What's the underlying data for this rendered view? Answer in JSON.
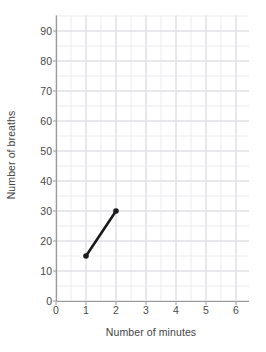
{
  "chart_data": {
    "type": "line",
    "title": "",
    "xlabel": "Number of minutes",
    "ylabel": "Number of breaths",
    "x": [
      1,
      2
    ],
    "values": [
      15,
      30
    ],
    "series": [
      {
        "name": "breaths",
        "x": [
          1,
          2
        ],
        "values": [
          15,
          30
        ]
      }
    ],
    "xlim": [
      0,
      6.3
    ],
    "ylim": [
      0,
      95
    ],
    "xticks": [
      0,
      1,
      2,
      3,
      4,
      5,
      6
    ],
    "yticks": [
      0,
      10,
      20,
      30,
      40,
      50,
      60,
      70,
      80,
      90
    ],
    "xtick_labels": [
      "0",
      "1",
      "2",
      "3",
      "4",
      "5",
      "6"
    ],
    "ytick_labels": [
      "0",
      "10",
      "20",
      "30",
      "40",
      "50",
      "60",
      "70",
      "80",
      "90"
    ],
    "grid": true,
    "grid_major_x_step": 1,
    "grid_minor_x_step": 0.5,
    "grid_major_y_step": 10,
    "grid_minor_y_step": 5,
    "legend": null,
    "legend_position": "none",
    "annotations": [],
    "markers": "circle",
    "colors": {
      "line": "#1a1a1a",
      "marker": "#1a1a1a",
      "grid_major": "#dcdce2",
      "grid_minor": "#ececf0",
      "axis": "#9a9a9a",
      "tick_text": "#4a4a4a",
      "axis_title": "#444444",
      "background": "#ffffff"
    }
  }
}
